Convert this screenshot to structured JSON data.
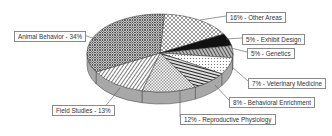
{
  "chart_data": {
    "type": "pie",
    "style": "3d-exploded-none-patterned",
    "title": "",
    "slices": [
      {
        "label": "Other Areas",
        "value": 16,
        "display": "16% - Other Areas",
        "pattern": "diag-cross-light"
      },
      {
        "label": "Exhibit Design",
        "value": 5,
        "display": "5% - Exhibit Design",
        "pattern": "solid-black"
      },
      {
        "label": "Genetics",
        "value": 5,
        "display": "5% -  Genetics",
        "pattern": "diag-stripes-dark"
      },
      {
        "label": "Veterinary Medicine",
        "value": 7,
        "display": "7% - Veterinary Medicine",
        "pattern": "dots-light"
      },
      {
        "label": "Behavioral Enrichment",
        "value": 8,
        "display": "8% - Behavioral Enrichment",
        "pattern": "horizontal-stripes"
      },
      {
        "label": "Reproductive Physiology",
        "value": 12,
        "display": "12% - Reproductive Physiology",
        "pattern": "checker-light"
      },
      {
        "label": "Field Studies",
        "value": 13,
        "display": "Field Studies - 13%",
        "pattern": "diag-stripes"
      },
      {
        "label": "Animal Behavior",
        "value": 34,
        "display": "Animal Behavior - 34%",
        "pattern": "crosshatch-dense"
      }
    ],
    "legend": "none (callout labels)",
    "start_angle_deg": 90,
    "direction": "clockwise"
  }
}
